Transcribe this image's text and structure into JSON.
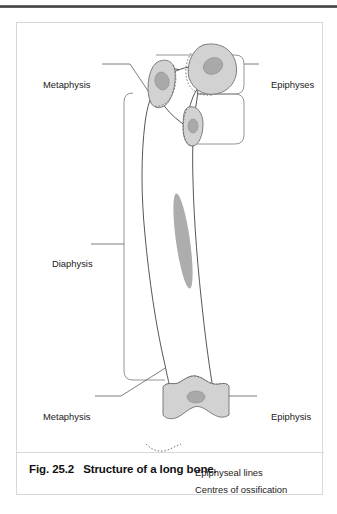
{
  "figure": {
    "caption_number": "Fig. 25.2",
    "caption_text": "Structure of a long bone."
  },
  "labels": {
    "metaphysis_top": "Metaphysis",
    "diaphysis": "Diaphysis",
    "metaphysis_bottom": "Metaphysis",
    "epiphyses": "Epiphyses",
    "epiphysis": "Epiphysis"
  },
  "legend": {
    "epiphyseal_lines": "Epiphyseal lines",
    "centres_of_ossification": "Centres of ossification"
  },
  "colors": {
    "bone_outline": "#4d4d4d",
    "bone_fill": "#ffffff",
    "epiphysis_fill": "#d2d2d2",
    "ossification_centre": "#a9a9a9",
    "leader_line": "#6e6e6e",
    "bracket": "#8a8a8a",
    "frame": "#d8d8d8",
    "top_rule": "#3b3b3b",
    "text": "#1a1a1a"
  },
  "diagram": {
    "type": "anatomical-illustration",
    "regions": [
      "proximal epiphyses",
      "metaphysis",
      "diaphysis",
      "distal epiphysis"
    ],
    "ossification_centres": 5
  }
}
